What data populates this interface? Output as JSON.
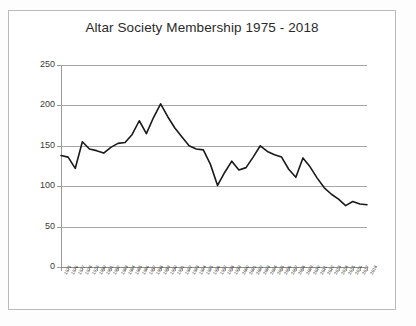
{
  "document": {
    "background_color": "#ffffff",
    "frame_color": "#b9b9b9"
  },
  "chart_data": {
    "type": "line",
    "title": "Altar Society Membership 1975 - 2018",
    "xlabel": "",
    "ylabel": "",
    "ylim": [
      0,
      250
    ],
    "ytick_values": [
      0,
      50,
      100,
      150,
      200,
      250
    ],
    "ytick_labels": [
      "0",
      "50",
      "100",
      "150",
      "200",
      "250"
    ],
    "grid": true,
    "grid_axis": "y",
    "legend": false,
    "legend_position": "none",
    "line_color": "#1a1a1a",
    "line_width": 1.6,
    "categories": [
      "1975",
      "1976",
      "1977",
      "1978",
      "1979",
      "1980",
      "1981",
      "1982",
      "1983",
      "1984",
      "1985",
      "1986",
      "1987",
      "1988",
      "1989",
      "1990",
      "1991",
      "1992",
      "1993",
      "1994",
      "1995",
      "1996",
      "1997",
      "1998",
      "1999",
      "2000",
      "2001",
      "2002",
      "2003",
      "2004",
      "2005",
      "2006",
      "2007",
      "2008",
      "2009",
      "2010",
      "2011",
      "2012",
      "2013",
      "2014",
      "2015",
      "2016",
      "2017",
      "2018"
    ],
    "series": [
      {
        "name": "Altar Society Membership",
        "values": [
          138,
          136,
          122,
          155,
          146,
          144,
          141,
          148,
          153,
          154,
          164,
          181,
          165,
          185,
          202,
          186,
          172,
          161,
          150,
          146,
          145,
          127,
          101,
          117,
          131,
          120,
          123,
          136,
          150,
          143,
          139,
          136,
          121,
          111,
          135,
          124,
          110,
          98,
          90,
          84,
          76,
          81,
          78,
          77
        ]
      }
    ]
  }
}
